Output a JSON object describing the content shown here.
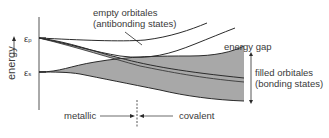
{
  "diagram": {
    "y_axis_label": "energy",
    "levels": {
      "p": {
        "symbol": "ε",
        "subscript": "p"
      },
      "s": {
        "symbol": "ε",
        "subscript": "s"
      }
    },
    "labels": {
      "empty_line1": "empty orbitales",
      "empty_line2": "(antibonding states)",
      "energy_gap": "energy gap",
      "filled_line1": "filled orbitales",
      "filled_line2": "(bonding states)",
      "metallic": "metallic",
      "covalent": "covalent"
    },
    "colors": {
      "line": "#2b2b2b",
      "fill": "#a8a8a8",
      "text": "#3a3a3a"
    }
  }
}
